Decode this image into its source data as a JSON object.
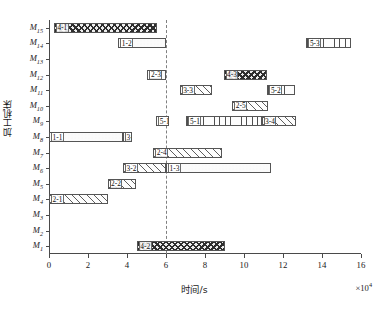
{
  "chart_data": {
    "type": "bar",
    "subtype": "gantt",
    "title": "",
    "xlabel": "时间/s",
    "ylabel": "加工机床",
    "x_exponent": "×10⁴",
    "xlim": [
      0,
      16
    ],
    "xticks": [
      0,
      2,
      4,
      6,
      8,
      10,
      12,
      14,
      16
    ],
    "xtick_labels": [
      "0",
      "2",
      "4",
      "6",
      "8",
      "10",
      "12",
      "14",
      "16"
    ],
    "grid": false,
    "legend": "none",
    "machines": [
      "M1",
      "M2",
      "M3",
      "M4",
      "M5",
      "M6",
      "M7",
      "M8",
      "M9",
      "M10",
      "M11",
      "M12",
      "M13",
      "M14",
      "M15"
    ],
    "machine_tick_labels": [
      "M₁",
      "M₂",
      "M₃",
      "M₄",
      "M₅",
      "M₆",
      "M₇",
      "M₈",
      "M₉",
      "M₁₀",
      "M₁₁",
      "M₁₂",
      "M₁₃",
      "M₁₄",
      "M₁₅"
    ],
    "annotations": [
      {
        "type": "vertical-dashed-line",
        "x": 6.0,
        "label": ""
      }
    ],
    "tasks": [
      {
        "machine": "M15",
        "label": "4-1",
        "start": 0.25,
        "end": 5.55,
        "fill": "cross"
      },
      {
        "machine": "M14",
        "label": "1-2",
        "start": 3.55,
        "end": 6.0,
        "fill": "dots"
      },
      {
        "machine": "M14",
        "label": "5-3",
        "start": 13.2,
        "end": 15.5,
        "fill": "vert"
      },
      {
        "machine": "M12",
        "label": "2-3",
        "start": 5.05,
        "end": 6.0,
        "fill": "plain"
      },
      {
        "machine": "M12",
        "label": "4-3",
        "start": 8.95,
        "end": 11.2,
        "fill": "cross"
      },
      {
        "machine": "M11",
        "label": "3-3",
        "start": 6.7,
        "end": 8.35,
        "fill": "diag"
      },
      {
        "machine": "M11",
        "label": "5-2",
        "start": 11.2,
        "end": 12.6,
        "fill": "vert"
      },
      {
        "machine": "M10",
        "label": "2-5",
        "start": 9.4,
        "end": 11.25,
        "fill": "diag"
      },
      {
        "machine": "M9",
        "label": "5-1",
        "start": 5.5,
        "end": 6.15,
        "fill": "plain"
      },
      {
        "machine": "M9",
        "label": "5-1",
        "start": 7.05,
        "end": 10.9,
        "fill": "vert"
      },
      {
        "machine": "M9",
        "label": "3-4",
        "start": 10.9,
        "end": 12.65,
        "fill": "diag"
      },
      {
        "machine": "M8",
        "label": "1-1",
        "start": 0.0,
        "end": 3.8,
        "fill": "dots"
      },
      {
        "machine": "M8",
        "label": "3-1",
        "start": 3.8,
        "end": 4.25,
        "fill": "plain"
      },
      {
        "machine": "M7",
        "label": "2-4",
        "start": 5.35,
        "end": 8.85,
        "fill": "diag"
      },
      {
        "machine": "M6",
        "label": "3-2",
        "start": 3.8,
        "end": 6.0,
        "fill": "diag"
      },
      {
        "machine": "M6",
        "label": "1-3",
        "start": 6.0,
        "end": 11.4,
        "fill": "dots"
      },
      {
        "machine": "M5",
        "label": "2-2",
        "start": 3.0,
        "end": 4.45,
        "fill": "diag"
      },
      {
        "machine": "M4",
        "label": "2-1",
        "start": 0.0,
        "end": 3.0,
        "fill": "diag"
      },
      {
        "machine": "M1",
        "label": "4-2",
        "start": 4.5,
        "end": 9.0,
        "fill": "cross"
      }
    ]
  }
}
